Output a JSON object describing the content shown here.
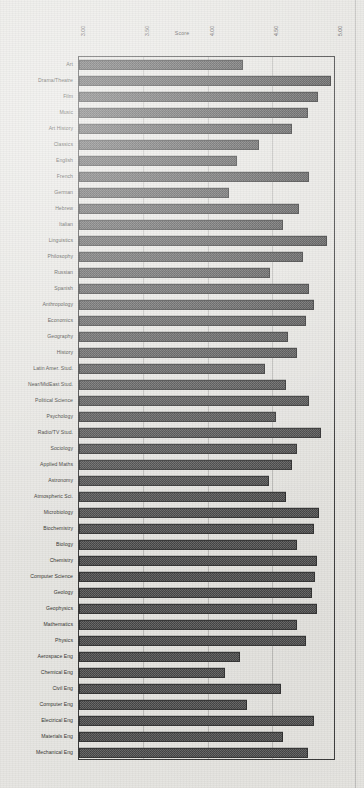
{
  "chart_data": {
    "type": "bar",
    "orientation": "horizontal",
    "title": "",
    "xlabel": "Score",
    "ylabel": "",
    "xlim": [
      3.0,
      5.0
    ],
    "xticks": [
      "3.00",
      "3.50",
      "4.00",
      "4.50",
      "5.00"
    ],
    "xtick_values": [
      3.0,
      3.5,
      4.0,
      4.5,
      5.0
    ],
    "grid": true,
    "legend": false,
    "categories": [
      "Art",
      "Drama/Theatre",
      "Film",
      "Music",
      "Art History",
      "Classics",
      "English",
      "French",
      "German",
      "Hebrew",
      "Italian",
      "Linguistics",
      "Philosophy",
      "Russian",
      "Spanish",
      "Anthropology",
      "Economics",
      "Geography",
      "History",
      "Latin Amer. Stud.",
      "Near/MidEast Stud.",
      "Political  Science",
      "Psychology",
      "Radio/TV Stud.",
      "Sociology",
      "Applied Maths",
      "Astronomy",
      "Atmospheric Sci.",
      "Microbiology",
      "Biochemistry",
      "Biology",
      "Chemistry",
      "Computer Science",
      "Geology",
      "Geophysics",
      "Mathematics",
      "Physics",
      "Aerospace Eng",
      "Chemical Eng",
      "Civil Eng",
      "Computer Eng",
      "Electrical Eng",
      "Materials  Eng",
      "Mechanical Eng"
    ],
    "values": [
      4.28,
      4.96,
      4.86,
      4.78,
      4.66,
      4.4,
      4.23,
      4.79,
      4.17,
      4.71,
      4.59,
      4.93,
      4.74,
      4.49,
      4.79,
      4.83,
      4.77,
      4.63,
      4.7,
      4.45,
      4.61,
      4.79,
      4.53,
      4.88,
      4.7,
      4.66,
      4.48,
      4.61,
      4.87,
      4.83,
      4.7,
      4.85,
      4.84,
      4.81,
      4.85,
      4.7,
      4.77,
      4.25,
      4.14,
      4.57,
      4.31,
      4.83,
      4.59,
      4.78
    ]
  },
  "colors": {
    "bar_fill": "#585858",
    "bar_edge": "#2f2f2f",
    "axis": "#3a3a3a",
    "grid": "#5a5a5a",
    "text": "#33332f",
    "page": "#e8e7e3"
  }
}
